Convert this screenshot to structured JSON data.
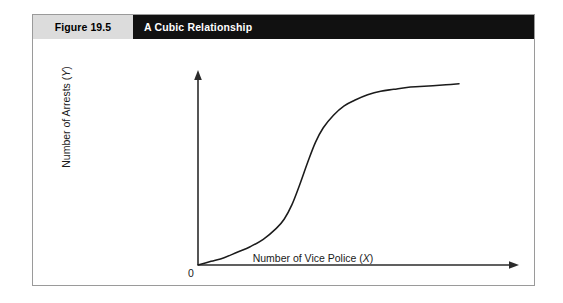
{
  "figure": {
    "number_label": "Figure 19.5",
    "title": "A Cubic Relationship",
    "header_gray": "#dcdcdc",
    "header_black": "#111111",
    "border_color": "#9a9a9a"
  },
  "chart_data": {
    "type": "line",
    "title": "A Cubic Relationship",
    "xlabel_prefix": "Number of Vice Police (",
    "xlabel_var": "X",
    "xlabel_suffix": ")",
    "ylabel_prefix": "Number of Arrests (",
    "ylabel_var": "Y",
    "ylabel_suffix": ")",
    "origin_label": "0",
    "grid": false,
    "legend": "none",
    "axis_arrows": true,
    "tick_labels_x": [],
    "tick_labels_y": [],
    "xlim": [
      0,
      1
    ],
    "ylim": [
      0,
      1
    ],
    "series": [
      {
        "name": "Cubic (S-shaped) relationship",
        "x": [
          0.0,
          0.05,
          0.1,
          0.15,
          0.2,
          0.25,
          0.3,
          0.33,
          0.36,
          0.39,
          0.42,
          0.45,
          0.48,
          0.52,
          0.56,
          0.6,
          0.65,
          0.7,
          0.75,
          0.8,
          0.85,
          0.9,
          0.95,
          1.0
        ],
        "y": [
          0.0,
          0.02,
          0.04,
          0.07,
          0.1,
          0.14,
          0.2,
          0.25,
          0.33,
          0.44,
          0.56,
          0.67,
          0.75,
          0.82,
          0.87,
          0.9,
          0.93,
          0.95,
          0.96,
          0.97,
          0.975,
          0.98,
          0.985,
          0.99
        ]
      }
    ]
  }
}
